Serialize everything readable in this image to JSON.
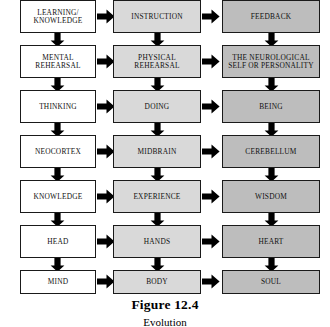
{
  "figure": {
    "caption": "Figure 12.4",
    "caption_subtitle": "Evolution",
    "columns": [
      {
        "id": "column-1",
        "color": "#ffffff",
        "shade": "white"
      },
      {
        "id": "column-2",
        "color": "#d9d9d9",
        "shade": "light-gray"
      },
      {
        "id": "column-3",
        "color": "#bdbdbd",
        "shade": "medium-gray"
      }
    ],
    "arrow_color": "#000000",
    "border_color": "#1a1a1a",
    "rows": [
      {
        "index": 1,
        "cells": [
          {
            "label": "LEARNING/\nKNOWLEDGE",
            "line1": "LEARNING/",
            "line2": "KNOWLEDGE"
          },
          {
            "label": "INSTRUCTION",
            "line1": "INSTRUCTION",
            "line2": ""
          },
          {
            "label": "FEEDBACK",
            "line1": "FEEDBACK",
            "line2": ""
          }
        ]
      },
      {
        "index": 2,
        "cells": [
          {
            "label": "MENTAL REHEARSAL",
            "line1": "MENTAL",
            "line2": "REHEARSAL"
          },
          {
            "label": "PHYSICAL REHEARSAL",
            "line1": "PHYSICAL",
            "line2": "REHEARSAL"
          },
          {
            "label": "THE NEUROLOGICAL SELF OR PERSONALITY",
            "line1": "THE NEUROLOGICAL",
            "line2": "SELF OR PERSONALITY"
          }
        ]
      },
      {
        "index": 3,
        "cells": [
          {
            "label": "THINKING",
            "line1": "THINKING",
            "line2": ""
          },
          {
            "label": "DOING",
            "line1": "DOING",
            "line2": ""
          },
          {
            "label": "BEING",
            "line1": "BEING",
            "line2": ""
          }
        ]
      },
      {
        "index": 4,
        "cells": [
          {
            "label": "NEOCORTEX",
            "line1": "NEOCORTEX",
            "line2": ""
          },
          {
            "label": "MIDBRAIN",
            "line1": "MIDBRAIN",
            "line2": ""
          },
          {
            "label": "CEREBELLUM",
            "line1": "CEREBELLUM",
            "line2": ""
          }
        ]
      },
      {
        "index": 5,
        "cells": [
          {
            "label": "KNOWLEDGE",
            "line1": "KNOWLEDGE",
            "line2": ""
          },
          {
            "label": "EXPERIENCE",
            "line1": "EXPERIENCE",
            "line2": ""
          },
          {
            "label": "WISDOM",
            "line1": "WISDOM",
            "line2": ""
          }
        ]
      },
      {
        "index": 6,
        "cells": [
          {
            "label": "HEAD",
            "line1": "HEAD",
            "line2": ""
          },
          {
            "label": "HANDS",
            "line1": "HANDS",
            "line2": ""
          },
          {
            "label": "HEART",
            "line1": "HEART",
            "line2": ""
          }
        ]
      },
      {
        "index": 7,
        "cells": [
          {
            "label": "MIND",
            "line1": "MIND",
            "line2": ""
          },
          {
            "label": "BODY",
            "line1": "BODY",
            "line2": ""
          },
          {
            "label": "SOUL",
            "line1": "SOUL",
            "line2": ""
          }
        ]
      }
    ]
  }
}
